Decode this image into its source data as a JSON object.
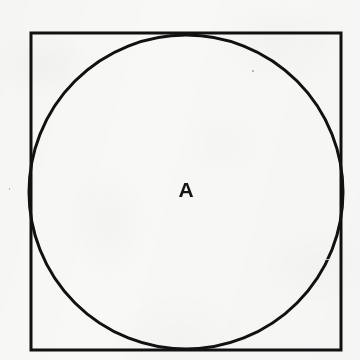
{
  "figure": {
    "background_color": "#f8f8f7",
    "stroke_color": "#111111",
    "label_color": "#141414"
  },
  "shapes": {
    "square": {
      "name": "outer square",
      "x": 31,
      "y": 33,
      "width": 310,
      "height": 317,
      "stroke_width": 3
    },
    "circle": {
      "name": "inscribed circle",
      "cx": 186,
      "cy": 192,
      "r": 157,
      "stroke_width": 3
    }
  },
  "labels": {
    "region_a": {
      "text": "A",
      "x": 186,
      "y": 189
    }
  },
  "specks": [
    {
      "x": 252,
      "y": 70,
      "w": 2,
      "h": 2
    },
    {
      "x": 326,
      "y": 259,
      "w": 3,
      "h": 1
    },
    {
      "x": 9,
      "y": 188,
      "w": 1,
      "h": 2
    }
  ]
}
